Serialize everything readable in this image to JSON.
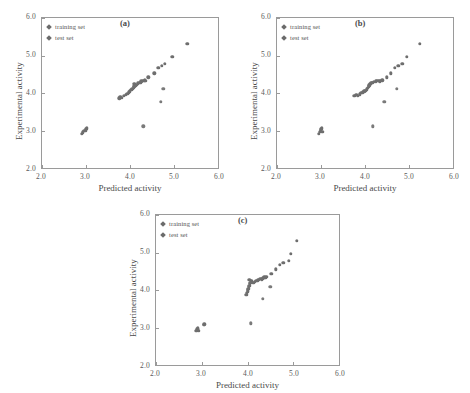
{
  "figure": {
    "background": "#ffffff",
    "marker_color": "#6e6e6e",
    "axis_color": "#9a9a9a"
  },
  "chart_data": [
    {
      "type": "scatter",
      "title": "(a)",
      "xlabel": "Predicted activity",
      "ylabel": "Experimental activity",
      "xlim": [
        2.0,
        6.0
      ],
      "ylim": [
        2.0,
        6.0
      ],
      "xticks": [
        "2.0",
        "3.0",
        "4.0",
        "5.0",
        "6.0"
      ],
      "yticks": [
        "2.0",
        "3.0",
        "4.0",
        "5.0",
        "6.0"
      ],
      "grid": false,
      "legend": [
        "training set",
        "test set"
      ],
      "legend_position": "top-left",
      "series": [
        {
          "name": "training set",
          "points": [
            [
              2.9,
              2.92
            ],
            [
              2.93,
              2.95
            ],
            [
              2.96,
              2.99
            ],
            [
              2.99,
              3.01
            ],
            [
              3.01,
              3.05
            ],
            [
              3.02,
              3.08
            ],
            [
              3.76,
              3.86
            ],
            [
              3.78,
              3.9
            ],
            [
              3.82,
              3.88
            ],
            [
              3.86,
              3.92
            ],
            [
              3.9,
              3.95
            ],
            [
              3.94,
              3.98
            ],
            [
              3.97,
              4.02
            ],
            [
              4.0,
              4.05
            ],
            [
              4.03,
              4.08
            ],
            [
              4.05,
              4.12
            ],
            [
              4.08,
              4.15
            ],
            [
              4.1,
              4.18
            ],
            [
              4.1,
              4.24
            ],
            [
              4.13,
              4.2
            ],
            [
              4.16,
              4.22
            ],
            [
              4.18,
              4.26
            ],
            [
              4.21,
              4.27
            ],
            [
              4.24,
              4.29
            ],
            [
              4.26,
              4.31
            ],
            [
              4.29,
              4.32
            ],
            [
              4.31,
              4.33
            ],
            [
              4.33,
              4.34
            ],
            [
              4.35,
              4.32
            ],
            [
              4.42,
              4.42
            ],
            [
              4.55,
              4.53
            ],
            [
              4.64,
              4.68
            ],
            [
              4.72,
              4.72
            ],
            [
              4.79,
              4.78
            ],
            [
              4.96,
              4.97
            ],
            [
              5.3,
              5.31
            ]
          ]
        },
        {
          "name": "test set",
          "points": [
            [
              4.3,
              3.11
            ],
            [
              4.7,
              3.76
            ],
            [
              4.76,
              4.11
            ]
          ]
        }
      ]
    },
    {
      "type": "scatter",
      "title": "(b)",
      "xlabel": "Predicted activity",
      "ylabel": "Experimental activity",
      "xlim": [
        2.0,
        6.0
      ],
      "ylim": [
        2.0,
        6.0
      ],
      "xticks": [
        "2.0",
        "3.0",
        "4.0",
        "5.0",
        "6.0"
      ],
      "yticks": [
        "2.0",
        "3.0",
        "4.0",
        "5.0",
        "6.0"
      ],
      "grid": false,
      "legend": [
        "training set",
        "test set"
      ],
      "legend_position": "top-left",
      "series": [
        {
          "name": "training set",
          "points": [
            [
              2.95,
              2.92
            ],
            [
              2.97,
              2.96
            ],
            [
              2.99,
              2.99
            ],
            [
              3.0,
              3.02
            ],
            [
              3.01,
              3.05
            ],
            [
              3.02,
              3.08
            ],
            [
              3.03,
              2.97
            ],
            [
              3.76,
              3.93
            ],
            [
              3.8,
              3.96
            ],
            [
              3.84,
              3.92
            ],
            [
              3.88,
              3.97
            ],
            [
              3.92,
              4.0
            ],
            [
              3.95,
              4.02
            ],
            [
              3.98,
              4.05
            ],
            [
              4.01,
              4.06
            ],
            [
              4.04,
              4.1
            ],
            [
              4.06,
              4.14
            ],
            [
              4.08,
              4.18
            ],
            [
              4.1,
              4.21
            ],
            [
              4.12,
              4.25
            ],
            [
              4.14,
              4.27
            ],
            [
              4.17,
              4.28
            ],
            [
              4.2,
              4.3
            ],
            [
              4.24,
              4.31
            ],
            [
              4.27,
              4.32
            ],
            [
              4.3,
              4.33
            ],
            [
              4.33,
              4.31
            ],
            [
              4.36,
              4.33
            ],
            [
              4.39,
              4.34
            ],
            [
              4.5,
              4.42
            ],
            [
              4.58,
              4.53
            ],
            [
              4.68,
              4.68
            ],
            [
              4.76,
              4.72
            ],
            [
              4.85,
              4.78
            ],
            [
              4.95,
              4.97
            ],
            [
              5.25,
              5.31
            ]
          ]
        },
        {
          "name": "test set",
          "points": [
            [
              4.18,
              3.11
            ],
            [
              4.44,
              3.76
            ],
            [
              4.72,
              4.11
            ]
          ]
        }
      ]
    },
    {
      "type": "scatter",
      "title": "(c)",
      "xlabel": "Predicted activity",
      "ylabel": "Experimental activity",
      "xlim": [
        2.0,
        6.0
      ],
      "ylim": [
        2.0,
        6.0
      ],
      "xticks": [
        "2.0",
        "3.0",
        "4.0",
        "5.0",
        "6.0"
      ],
      "yticks": [
        "2.0",
        "3.0",
        "4.0",
        "5.0",
        "6.0"
      ],
      "grid": false,
      "legend": [
        "training set",
        "test set"
      ],
      "legend_position": "top-left",
      "series": [
        {
          "name": "training set",
          "points": [
            [
              2.88,
              2.92
            ],
            [
              2.9,
              2.95
            ],
            [
              2.92,
              2.98
            ],
            [
              2.93,
              2.91
            ],
            [
              3.04,
              3.07
            ],
            [
              3.06,
              3.09
            ],
            [
              3.97,
              3.88
            ],
            [
              3.99,
              3.93
            ],
            [
              4.0,
              3.97
            ],
            [
              4.01,
              4.0
            ],
            [
              4.02,
              4.04
            ],
            [
              4.03,
              4.08
            ],
            [
              4.04,
              4.12
            ],
            [
              4.05,
              4.16
            ],
            [
              4.06,
              4.2
            ],
            [
              4.07,
              4.24
            ],
            [
              4.04,
              4.27
            ],
            [
              4.1,
              4.23
            ],
            [
              4.13,
              4.19
            ],
            [
              4.16,
              4.22
            ],
            [
              4.19,
              4.24
            ],
            [
              4.22,
              4.26
            ],
            [
              4.25,
              4.28
            ],
            [
              4.28,
              4.3
            ],
            [
              4.31,
              4.29
            ],
            [
              4.34,
              4.31
            ],
            [
              4.37,
              4.34
            ],
            [
              4.39,
              4.33
            ],
            [
              4.41,
              4.35
            ],
            [
              4.52,
              4.43
            ],
            [
              4.62,
              4.55
            ],
            [
              4.7,
              4.68
            ],
            [
              4.78,
              4.72
            ],
            [
              4.9,
              4.78
            ],
            [
              4.94,
              4.97
            ],
            [
              5.08,
              5.31
            ]
          ]
        },
        {
          "name": "test set",
          "points": [
            [
              4.07,
              3.11
            ],
            [
              4.33,
              3.76
            ],
            [
              4.5,
              4.08
            ]
          ]
        }
      ]
    }
  ]
}
